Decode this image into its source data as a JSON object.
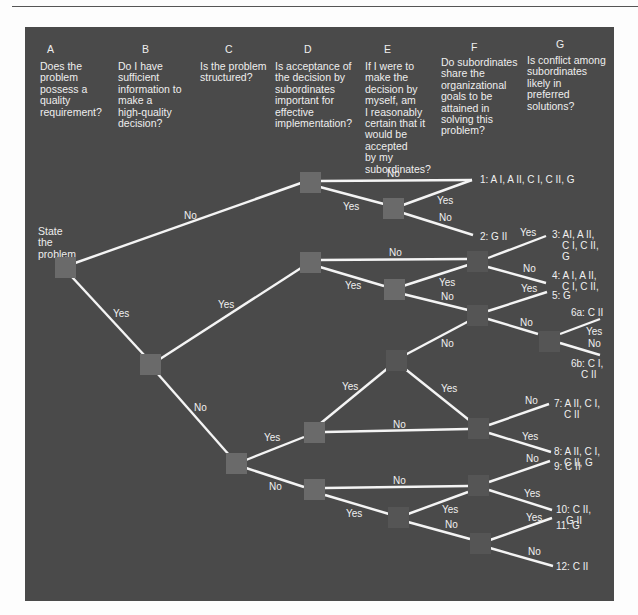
{
  "diagram": {
    "type": "decision-tree",
    "start_label": [
      "State",
      "the",
      "problem"
    ],
    "columns": [
      {
        "letter": "A",
        "question": [
          "Does the",
          "problem",
          "possess a",
          "quality",
          "requirement?"
        ]
      },
      {
        "letter": "B",
        "question": [
          "Do I have",
          "sufficient",
          "information to",
          "make a",
          "high-quality",
          "decision?"
        ]
      },
      {
        "letter": "C",
        "question": [
          "Is the problem",
          "structured?"
        ]
      },
      {
        "letter": "D",
        "question": [
          "Is acceptance of",
          "the decision by",
          "subordinates",
          "important for",
          "effective",
          "implementation?"
        ]
      },
      {
        "letter": "E",
        "question": [
          "If I were to",
          "make the",
          "decision by",
          "myself, am",
          "I reasonably",
          "certain that it",
          "would be",
          "accepted",
          "by my",
          "subordinates?"
        ]
      },
      {
        "letter": "F",
        "question": [
          "Do subordinates",
          "share the",
          "organizational",
          "goals to be",
          "attained in",
          "solving this",
          "problem?"
        ]
      },
      {
        "letter": "G",
        "question": [
          "Is conflict among",
          "subordinates",
          "likely in",
          "preferred",
          "solutions?"
        ]
      }
    ],
    "edge_labels": {
      "yes": "Yes",
      "no": "No"
    },
    "outcomes": [
      {
        "id": "1",
        "lines": [
          "1: A I, A II, C I, C II, G"
        ]
      },
      {
        "id": "2",
        "lines": [
          "2: G II"
        ]
      },
      {
        "id": "3",
        "lines": [
          "3: AI, A II,",
          "C I, C II,",
          "G"
        ]
      },
      {
        "id": "4",
        "lines": [
          "4: A I, A II,",
          "C I, C II,"
        ]
      },
      {
        "id": "5",
        "lines": [
          "5: G"
        ]
      },
      {
        "id": "6a",
        "lines": [
          "6a: C II"
        ]
      },
      {
        "id": "6b",
        "lines": [
          "6b: C I,",
          "C II"
        ]
      },
      {
        "id": "7",
        "lines": [
          "7: A II, C I,",
          "C II"
        ]
      },
      {
        "id": "8",
        "lines": [
          "8: A II, C I,",
          "C II, G"
        ]
      },
      {
        "id": "9",
        "lines": [
          "9: C II"
        ]
      },
      {
        "id": "10",
        "lines": [
          "10: C II,",
          "G II"
        ]
      },
      {
        "id": "11",
        "lines": [
          "11: G"
        ]
      },
      {
        "id": "12",
        "lines": [
          "12: C II"
        ]
      }
    ],
    "colors": {
      "panel": "#4a4a4a",
      "node": "#6a6a6a",
      "line": "#f4f4f4",
      "text": "#eeeeee"
    }
  }
}
